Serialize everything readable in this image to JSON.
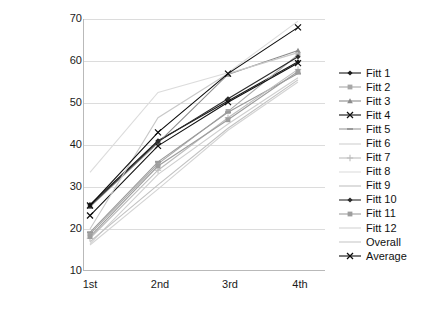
{
  "chart_data": {
    "type": "line",
    "title": "",
    "xlabel": "",
    "ylabel": "",
    "categories": [
      "1st",
      "2nd",
      "3rd",
      "4th"
    ],
    "ylim": [
      10,
      70
    ],
    "yticks": [
      10,
      20,
      30,
      40,
      50,
      60,
      70
    ],
    "grid": true,
    "legend_position": "right",
    "series": [
      {
        "name": "Fitt 1",
        "marker": "diamond",
        "color": "#1a1a1a",
        "values": [
          25.8,
          41.0,
          50.5,
          59.8
        ]
      },
      {
        "name": "Fitt 2",
        "marker": "square",
        "color": "#a8a8a8",
        "values": [
          18.8,
          35.5,
          48.0,
          61.5
        ]
      },
      {
        "name": "Fitt 3",
        "marker": "triangle",
        "color": "#8c8c8c",
        "values": [
          25.3,
          40.5,
          56.8,
          62.5
        ]
      },
      {
        "name": "Fitt 4",
        "marker": "cross",
        "color": "#111111",
        "values": [
          23.2,
          39.8,
          50.2,
          59.5
        ]
      },
      {
        "name": "Fitt 5",
        "marker": "dash",
        "color": "#9a9a9a",
        "values": [
          19.2,
          36.0,
          47.8,
          57.0
        ]
      },
      {
        "name": "Fitt 6",
        "marker": "none",
        "color": "#cfcfcf",
        "values": [
          16.5,
          33.0,
          45.0,
          56.0
        ]
      },
      {
        "name": "Fitt 7",
        "marker": "plus",
        "color": "#bdbdbd",
        "values": [
          17.8,
          34.0,
          46.5,
          58.0
        ]
      },
      {
        "name": "Fitt 8",
        "marker": "none",
        "color": "#dcdcdc",
        "values": [
          33.5,
          52.5,
          57.2,
          69.5
        ]
      },
      {
        "name": "Fitt 9",
        "marker": "none",
        "color": "#c2c2c2",
        "values": [
          17.0,
          30.5,
          44.0,
          55.5
        ]
      },
      {
        "name": "Fitt 10",
        "marker": "diamond",
        "color": "#2b2b2b",
        "values": [
          25.5,
          40.8,
          51.0,
          61.0
        ]
      },
      {
        "name": "Fitt 11",
        "marker": "square",
        "color": "#9e9e9e",
        "values": [
          18.2,
          35.0,
          46.0,
          57.5
        ]
      },
      {
        "name": "Fitt 12",
        "marker": "none",
        "color": "#d4d4d4",
        "values": [
          16.2,
          29.5,
          43.5,
          55.0
        ]
      },
      {
        "name": "Overall",
        "marker": "none",
        "color": "#c8c8c8",
        "values": [
          20.0,
          46.5,
          57.0,
          62.0
        ]
      },
      {
        "name": "Average",
        "marker": "cross",
        "color": "#0d0d0d",
        "values": [
          25.6,
          43.0,
          57.0,
          68.0
        ]
      }
    ]
  },
  "legend": {
    "items": [
      {
        "label": "Fitt 1"
      },
      {
        "label": "Fitt 2"
      },
      {
        "label": "Fitt 3"
      },
      {
        "label": "Fitt 4"
      },
      {
        "label": "Fitt 5"
      },
      {
        "label": "Fitt 6"
      },
      {
        "label": "Fitt 7"
      },
      {
        "label": "Fitt 8"
      },
      {
        "label": "Fitt 9"
      },
      {
        "label": "Fitt 10"
      },
      {
        "label": "Fitt 11"
      },
      {
        "label": "Fitt 12"
      },
      {
        "label": "Overall"
      },
      {
        "label": "Average"
      }
    ]
  },
  "axes": {
    "y_labels": [
      "70",
      "60",
      "50",
      "40",
      "30",
      "20",
      "10"
    ],
    "x_labels": [
      "1st",
      "2nd",
      "3rd",
      "4th"
    ]
  }
}
